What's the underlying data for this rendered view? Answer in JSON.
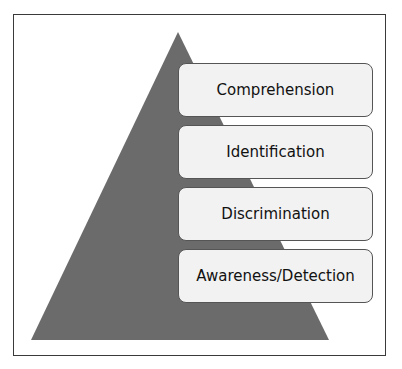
{
  "diagram": {
    "type": "pyramid",
    "colors": {
      "triangle": "#6b6b6b",
      "box_fill": "#f2f2f2",
      "box_border": "#555555",
      "frame_border": "#3a3a3a"
    },
    "levels": [
      {
        "label": "Comprehension"
      },
      {
        "label": "Identification"
      },
      {
        "label": "Discrimination"
      },
      {
        "label": "Awareness/Detection"
      }
    ]
  }
}
